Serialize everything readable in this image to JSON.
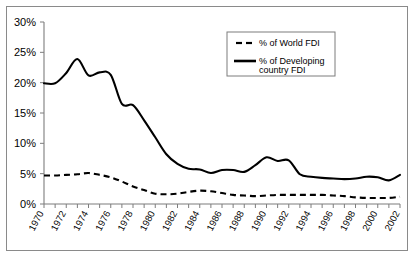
{
  "chart_data": {
    "type": "line",
    "title": "",
    "subtitle": "",
    "xlabel": "",
    "ylabel": "",
    "ylim": [
      0,
      30
    ],
    "xlim": [
      1970,
      2002
    ],
    "grid": false,
    "legend_position": "top-right",
    "ytick_labels": [
      "0%",
      "5%",
      "10%",
      "15%",
      "20%",
      "25%",
      "30%"
    ],
    "ytick_values": [
      0,
      5,
      10,
      15,
      20,
      25,
      30
    ],
    "xtick_labels": [
      "1970",
      "1972",
      "1974",
      "1976",
      "1978",
      "1980",
      "1982",
      "1984",
      "1986",
      "1988",
      "1990",
      "1992",
      "1994",
      "1996",
      "1998",
      "2000",
      "2002"
    ],
    "x": [
      1970,
      1971,
      1972,
      1973,
      1974,
      1975,
      1976,
      1977,
      1978,
      1979,
      1980,
      1981,
      1982,
      1983,
      1984,
      1985,
      1986,
      1987,
      1988,
      1989,
      1990,
      1991,
      1992,
      1993,
      1994,
      1995,
      1996,
      1997,
      1998,
      1999,
      2000,
      2001,
      2002
    ],
    "series": [
      {
        "name": "% of World FDI",
        "style": "dashed",
        "color": "#000000",
        "values": [
          4.7,
          4.7,
          4.8,
          4.9,
          5.1,
          4.8,
          4.4,
          3.7,
          2.9,
          2.3,
          1.7,
          1.6,
          1.7,
          2.0,
          2.2,
          2.1,
          1.8,
          1.5,
          1.4,
          1.3,
          1.4,
          1.5,
          1.5,
          1.5,
          1.5,
          1.5,
          1.4,
          1.3,
          1.1,
          1.0,
          1.0,
          1.0,
          1.2
        ]
      },
      {
        "name": "% of Developing country FDI",
        "style": "solid",
        "color": "#000000",
        "values": [
          19.9,
          19.9,
          21.6,
          23.9,
          21.2,
          21.7,
          21.3,
          16.5,
          16.3,
          13.8,
          11.0,
          8.2,
          6.6,
          5.8,
          5.7,
          5.1,
          5.6,
          5.6,
          5.3,
          6.4,
          7.7,
          7.1,
          7.2,
          4.9,
          4.5,
          4.3,
          4.2,
          4.1,
          4.2,
          4.5,
          4.4,
          3.9,
          4.8
        ]
      }
    ],
    "legend": [
      {
        "label": "% of World FDI",
        "style": "dashed"
      },
      {
        "label_line1": "% of Developing",
        "label_line2": "country FDI",
        "style": "solid"
      }
    ]
  }
}
